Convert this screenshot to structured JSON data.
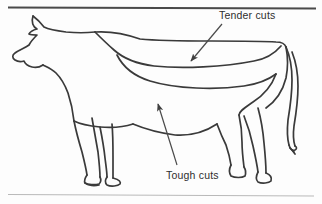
{
  "figure": {
    "kind": "line-diagram",
    "background_color": "#fdfdfd",
    "ink_color": "#2e2e2e",
    "outline_color": "#3a3a3a",
    "rule_top_color": "#4a4a4a",
    "rule_bottom_color": "#b9b9b9"
  },
  "labels": {
    "tender": "Tender cuts",
    "tough": "Tough cuts"
  },
  "annotations": [
    {
      "name": "tender-cuts-annotation",
      "text": "Tender cuts",
      "arrow_from": [
        222,
        24
      ],
      "arrow_to": [
        190,
        62
      ],
      "points_at": "loin-and-rib-band"
    },
    {
      "name": "tough-cuts-annotation",
      "text": "Tough cuts",
      "arrow_from": [
        176,
        166
      ],
      "arrow_to": [
        157,
        103
      ],
      "points_at": "belly-and-flank"
    }
  ],
  "rules": {
    "top": {
      "y": 7,
      "x1": 8,
      "x2": 316,
      "weight": 2.0
    },
    "bottom": {
      "y": 195,
      "x1": 8,
      "x2": 314,
      "weight": 1.0
    }
  },
  "icon_names": [
    "cow-outline-icon",
    "tender-cuts-arrow-icon",
    "tough-cuts-arrow-icon",
    "top-rule-icon",
    "bottom-rule-icon"
  ]
}
